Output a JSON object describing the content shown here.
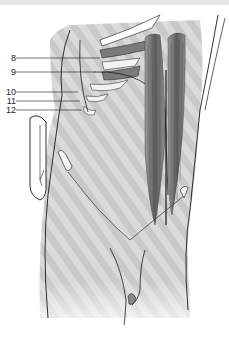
{
  "figure": {
    "labels": [
      {
        "text": "8",
        "x": 0,
        "y": 54,
        "line_to_x": 100,
        "line_y": 58
      },
      {
        "text": "9",
        "x": 0,
        "y": 68,
        "line_to_x": 95,
        "line_y": 72
      },
      {
        "text": "10",
        "x": 0,
        "y": 88,
        "line_to_x": 78,
        "line_y": 92
      },
      {
        "text": "11",
        "x": 0,
        "y": 96,
        "line_to_x": 80,
        "line_y": 101
      },
      {
        "text": "12",
        "x": 0,
        "y": 105,
        "line_to_x": 82,
        "line_y": 110
      }
    ],
    "colors": {
      "background": "#ffffff",
      "skin_shading": "#d4d4d4",
      "muscle_dark": "#5a5a5a",
      "muscle_mid": "#8a8a8a",
      "rib_cartilage": "#7a7a7a",
      "outline": "#1a1a1a",
      "bone": "#f2f2f2"
    }
  }
}
